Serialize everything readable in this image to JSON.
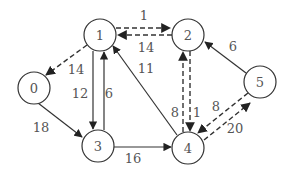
{
  "nodes": [
    {
      "id": "0",
      "label": "0",
      "x": 34,
      "y": 88
    },
    {
      "id": "1",
      "label": "1",
      "x": 100,
      "y": 35
    },
    {
      "id": "2",
      "label": "2",
      "x": 188,
      "y": 35
    },
    {
      "id": "3",
      "label": "3",
      "x": 98,
      "y": 146
    },
    {
      "id": "4",
      "label": "4",
      "x": 188,
      "y": 148
    },
    {
      "id": "5",
      "label": "5",
      "x": 260,
      "y": 82
    }
  ],
  "edges": [
    {
      "from": "1",
      "to": "2",
      "weight": "1",
      "style": "dashed"
    },
    {
      "from": "2",
      "to": "1",
      "weight": "14",
      "style": "dashed"
    },
    {
      "from": "1",
      "to": "0",
      "weight": "14",
      "style": "dashed"
    },
    {
      "from": "1",
      "to": "3",
      "weight": "12",
      "style": "solid"
    },
    {
      "from": "3",
      "to": "1",
      "weight": "6",
      "style": "solid"
    },
    {
      "from": "0",
      "to": "3",
      "weight": "18",
      "style": "solid"
    },
    {
      "from": "4",
      "to": "1",
      "weight": "11",
      "style": "solid"
    },
    {
      "from": "3",
      "to": "4",
      "weight": "16",
      "style": "solid"
    },
    {
      "from": "4",
      "to": "2",
      "weight": "8",
      "style": "dashed"
    },
    {
      "from": "2",
      "to": "4",
      "weight": "1",
      "style": "dashed"
    },
    {
      "from": "5",
      "to": "2",
      "weight": "6",
      "style": "solid"
    },
    {
      "from": "5",
      "to": "4",
      "weight": "8",
      "style": "dashed"
    },
    {
      "from": "4",
      "to": "5",
      "weight": "20",
      "style": "dashed"
    }
  ],
  "colors": {
    "stroke": "#333333",
    "text": "#555555",
    "background": "#ffffff"
  }
}
